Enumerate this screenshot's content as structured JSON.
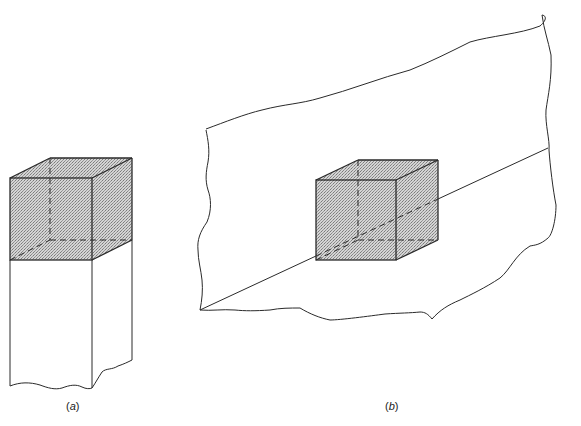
{
  "figure": {
    "colors": {
      "line": "#2a2a2a",
      "shade": "#bdbdbd",
      "background": "#ffffff"
    },
    "panels": [
      {
        "id": "a",
        "label_open": "(",
        "label_letter": "a",
        "label_close": ")",
        "content": "shaded cube on top of a column with a wavy broken bottom edge"
      },
      {
        "id": "b",
        "label_open": "(",
        "label_letter": "b",
        "label_close": ")",
        "content": "shaded cube within a large irregular slab; a straight line passes diagonally through the cube"
      }
    ]
  }
}
